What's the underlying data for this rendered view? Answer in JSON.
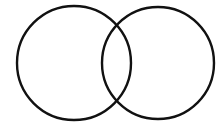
{
  "diagram": {
    "type": "venn",
    "sets": [
      {
        "name": "left-set",
        "label": ""
      },
      {
        "name": "right-set",
        "label": ""
      }
    ],
    "stroke_color": "#111111",
    "background_color": "#ffffff"
  }
}
